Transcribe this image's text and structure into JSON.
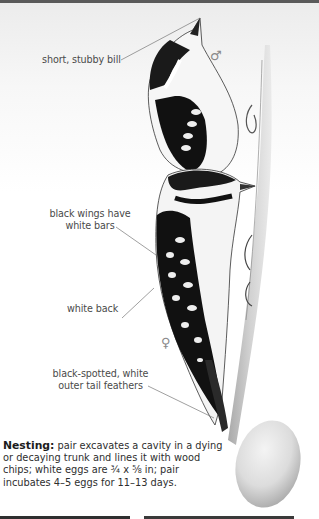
{
  "callouts": {
    "bill": "short, stubby bill",
    "wings_line1": "black wings have",
    "wings_line2": "white bars",
    "back": "white back",
    "tail_line1": "black-spotted, white",
    "tail_line2": "outer tail feathers"
  },
  "symbols": {
    "male": "♂",
    "female": "♀"
  },
  "nesting": {
    "heading": "Nesting:",
    "text": " pair excavates a cavity in a dying or decaying trunk and lines it with wood chips; white eggs are ¾ x ⅝ in; pair incubates 4–5 eggs for 11–13 days."
  },
  "colors": {
    "top_bar": "#5a5a5a",
    "bottom_bar": "#2f2f2f",
    "label_text": "#4a4a4a"
  }
}
